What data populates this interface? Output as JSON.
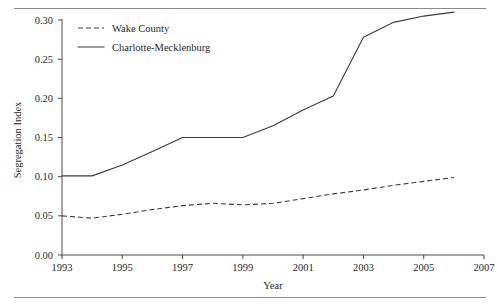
{
  "chart_data": {
    "type": "line",
    "title": "",
    "xlabel": "Year",
    "ylabel": "Segregation Index",
    "xlim": [
      1993,
      2007
    ],
    "ylim": [
      0.0,
      0.3
    ],
    "grid": false,
    "legend_position": "top-left",
    "x_ticks": [
      "1993",
      "1995",
      "1997",
      "1999",
      "2001",
      "2003",
      "2005",
      "2007"
    ],
    "x_tick_values": [
      1993,
      1995,
      1997,
      1999,
      2001,
      2003,
      2005,
      2007
    ],
    "y_ticks": [
      "0.00",
      "0.05",
      "0.10",
      "0.15",
      "0.20",
      "0.25",
      "0.30"
    ],
    "y_tick_values": [
      0.0,
      0.05,
      0.1,
      0.15,
      0.2,
      0.25,
      0.3
    ],
    "x": [
      1993,
      1994,
      1995,
      1996,
      1997,
      1998,
      1999,
      2000,
      2001,
      2002,
      2003,
      2004,
      2005,
      2006
    ],
    "series": [
      {
        "name": "Wake County",
        "style": "dashed",
        "color": "#3a3a3a",
        "values": [
          0.05,
          0.047,
          0.052,
          0.058,
          0.063,
          0.066,
          0.064,
          0.066,
          0.072,
          0.078,
          0.083,
          0.089,
          0.094,
          0.099
        ]
      },
      {
        "name": "Charlotte-Mecklenburg",
        "style": "solid",
        "color": "#3a3a3a",
        "values": [
          0.101,
          0.101,
          0.115,
          0.132,
          0.15,
          0.15,
          0.15,
          0.165,
          0.185,
          0.203,
          0.278,
          0.297,
          0.305,
          0.31
        ]
      }
    ]
  },
  "legend": {
    "items": [
      {
        "label": "Wake County",
        "style": "dashed"
      },
      {
        "label": "Charlotte-Mecklenburg",
        "style": "solid"
      }
    ]
  },
  "axes": {
    "x_title": "Year",
    "y_title": "Segregation Index"
  }
}
